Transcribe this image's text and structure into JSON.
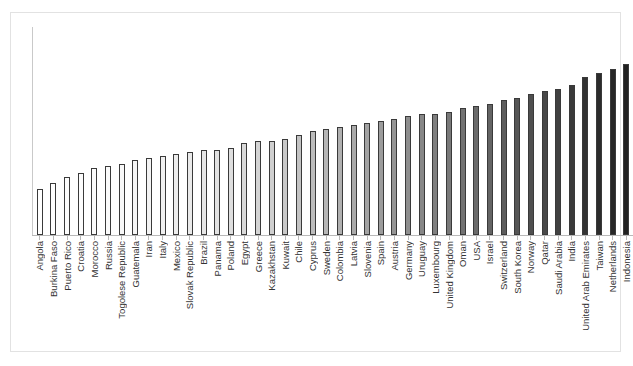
{
  "chart_data": {
    "type": "bar",
    "title": "",
    "subtitle": "",
    "xlabel": "",
    "ylabel": "",
    "grid": false,
    "legend": false,
    "y_tick_labels": [],
    "x_tick_labels_rotated": true,
    "ylim": [
      0,
      100
    ],
    "categories": [
      "Angola",
      "Burkina Faso",
      "Puerto Rico",
      "Croatia",
      "Morocco",
      "Russia",
      "Togolese Republic",
      "Guatemala",
      "Iran",
      "Italy",
      "Mexico",
      "Slovak Republic",
      "Brazil",
      "Panama",
      "Poland",
      "Egypt",
      "Greece",
      "Kazakhstan",
      "Kuwait",
      "Chile",
      "Cyprus",
      "Sweden",
      "Colombia",
      "Latvia",
      "Slovenia",
      "Spain",
      "Austria",
      "Germany",
      "Uruguay",
      "Luxembourg",
      "United Kingdom",
      "Oman",
      "USA",
      "Israel",
      "Switzerland",
      "South Korea",
      "Norway",
      "Qatar",
      "Saudi Arabia",
      "India",
      "United Arab Emirates",
      "Taiwan",
      "Netherlands",
      "Indonesia"
    ],
    "values": [
      22,
      25,
      28,
      30,
      32,
      33,
      34,
      36,
      37,
      38,
      39,
      40,
      41,
      41,
      42,
      44,
      45,
      45,
      46,
      48,
      50,
      51,
      52,
      53,
      54,
      55,
      56,
      57,
      58,
      58,
      59,
      61,
      62,
      63,
      65,
      66,
      68,
      69,
      70,
      72,
      76,
      78,
      80,
      82
    ],
    "bar_shades": [
      "#ffffff",
      "#ffffff",
      "#fdfdfd",
      "#fcfcfc",
      "#fbfbfb",
      "#fafafa",
      "#f8f8f8",
      "#f6f6f6",
      "#f3f3f3",
      "#f0f0f0",
      "#ededed",
      "#eaeaea",
      "#e6e6e6",
      "#e2e2e2",
      "#dedede",
      "#d9d9d9",
      "#d4d4d4",
      "#cfcfcf",
      "#c9c9c9",
      "#c3c3c3",
      "#bdbdbd",
      "#b7b7b7",
      "#b0b0b0",
      "#aaaaaa",
      "#a3a3a3",
      "#9c9c9c",
      "#959595",
      "#8e8e8e",
      "#878787",
      "#808080",
      "#797979",
      "#727272",
      "#6b6b6b",
      "#646464",
      "#5d5d5d",
      "#565656",
      "#4f4f4f",
      "#484848",
      "#414141",
      "#3a3a3a",
      "#333333",
      "#2c2c2c",
      "#262626",
      "#202020"
    ],
    "bar_outline_color": "#3a3a3a",
    "frame_color": "#e2e2e2",
    "axis_color": "#b9b9b9",
    "label_color": "#333333",
    "background_color": "#ffffff"
  }
}
